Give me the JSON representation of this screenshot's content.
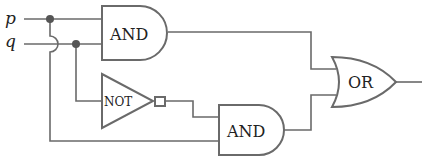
{
  "diagram": {
    "type": "logic-circuit",
    "inputs": [
      {
        "id": "p",
        "label": "p"
      },
      {
        "id": "q",
        "label": "q"
      }
    ],
    "gates": [
      {
        "id": "and1",
        "type": "AND",
        "label": "AND",
        "inputs": [
          "p",
          "q"
        ]
      },
      {
        "id": "not1",
        "type": "NOT",
        "label": "NOT",
        "inputs": [
          "q"
        ]
      },
      {
        "id": "and2",
        "type": "AND",
        "label": "AND",
        "inputs": [
          "not1",
          "p"
        ]
      },
      {
        "id": "or1",
        "type": "OR",
        "label": "OR",
        "inputs": [
          "and1",
          "and2"
        ]
      }
    ],
    "colors": {
      "wire": "#6a6a6a",
      "gate_stroke": "#6a6a6a",
      "junction": "#555555",
      "text": "#222222",
      "background": "#ffffff"
    }
  }
}
